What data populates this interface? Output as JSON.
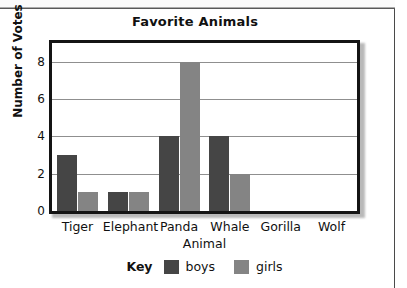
{
  "chart_data": {
    "type": "bar",
    "title": "Favorite Animals",
    "xlabel": "Animal",
    "ylabel": "Number of Votes",
    "categories": [
      "Tiger",
      "Elephant",
      "Panda",
      "Whale",
      "Gorilla",
      "Wolf"
    ],
    "series": [
      {
        "name": "boys",
        "color": "#454545",
        "values": [
          3,
          1,
          4,
          4,
          0,
          0
        ]
      },
      {
        "name": "girls",
        "color": "#848484",
        "values": [
          1,
          1,
          8,
          2,
          0,
          0
        ]
      }
    ],
    "ylim": [
      0,
      9
    ],
    "yticks": [
      0,
      2,
      4,
      6,
      8
    ],
    "ytick_labels": [
      "0",
      "2",
      "4",
      "6",
      "8"
    ],
    "grid": "horizontal",
    "legend_position": "bottom",
    "legend_title": "Key"
  }
}
